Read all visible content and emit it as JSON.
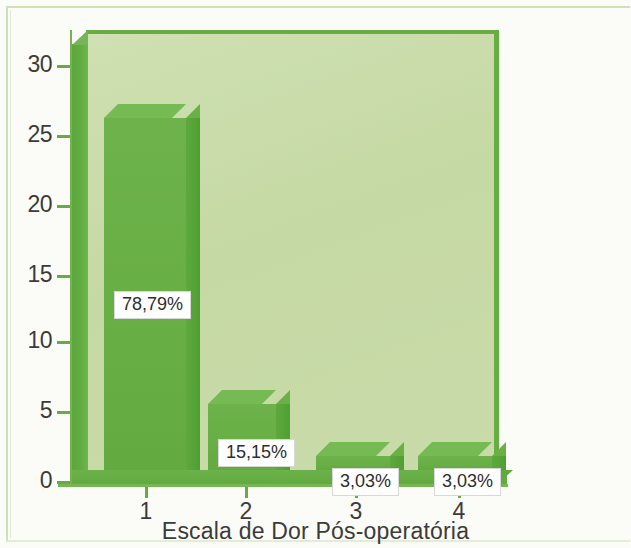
{
  "chart_data": {
    "type": "bar",
    "title": "",
    "subtitle": "",
    "xlabel": "Escala de Dor Pós-operatória",
    "ylabel": "",
    "categories": [
      "1",
      "2",
      "3",
      "4"
    ],
    "values": [
      26,
      5,
      1,
      1
    ],
    "data_labels": [
      "78,79%",
      "15,15%",
      "3,03%",
      "3,03%"
    ],
    "ylim": [
      0,
      33
    ],
    "y_ticks": [
      "0",
      "5",
      "10",
      "15",
      "20",
      "25",
      "30"
    ],
    "y_tick_values": [
      0,
      5,
      10,
      15,
      20,
      25,
      30
    ],
    "grid": false,
    "legend": null,
    "legend_position": "none",
    "style": "3d-column",
    "colors": {
      "bar_front": "#68af45",
      "bar_top": "#76ba54",
      "bar_side": "#59a63c",
      "plot_background": "#c5d9a4",
      "wall": "#5aa83c",
      "figure_background": "#fbfcf7",
      "axis": "#76b24f",
      "text": "#3b3b3b",
      "callout_background": "#ffffff"
    }
  },
  "axes": {
    "y_ticks": [
      {
        "label": "30",
        "top": 65
      },
      {
        "label": "25",
        "top": 135
      },
      {
        "label": "20",
        "top": 205
      },
      {
        "label": "15",
        "top": 275
      },
      {
        "label": "10",
        "top": 341
      },
      {
        "label": "5",
        "top": 411
      },
      {
        "label": "0",
        "top": 481
      }
    ],
    "x_ticks": [
      {
        "label": "1",
        "left": 145
      },
      {
        "label": "2",
        "left": 245
      },
      {
        "label": "3",
        "left": 355
      },
      {
        "label": "4",
        "left": 458
      }
    ],
    "x_title": "Escala de Dor Pós-operatória"
  },
  "bars": [
    {
      "category": "1",
      "value": 26,
      "label": "78,79%",
      "left": 104,
      "width": 82,
      "top": 118,
      "height": 352,
      "label_left": 114,
      "label_top": 291
    },
    {
      "category": "2",
      "value": 5,
      "label": "15,15%",
      "left": 208,
      "width": 68,
      "top": 404,
      "height": 66,
      "label_left": 218,
      "label_top": 439
    },
    {
      "category": "3",
      "value": 1,
      "label": "3,03%",
      "left": 316,
      "width": 74,
      "top": 456,
      "height": 14,
      "label_left": 332,
      "label_top": 468
    },
    {
      "category": "4",
      "value": 1,
      "label": "3,03%",
      "left": 418,
      "width": 74,
      "top": 456,
      "height": 14,
      "label_left": 434,
      "label_top": 468
    }
  ]
}
